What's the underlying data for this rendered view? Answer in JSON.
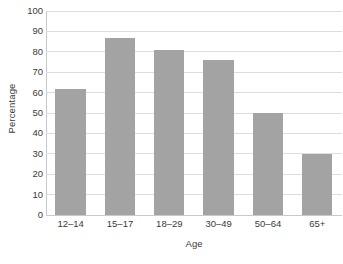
{
  "chart_data": {
    "type": "bar",
    "title": "",
    "subtitle": "",
    "categories": [
      "12–14",
      "15–17",
      "18–29",
      "30–49",
      "50–64",
      "65+"
    ],
    "values": [
      62,
      87,
      81,
      76,
      50,
      30
    ],
    "series": [
      {
        "name": "Percentage",
        "values": [
          62,
          87,
          81,
          76,
          50,
          30
        ]
      }
    ],
    "xlabel": "Age",
    "ylabel": "Percentage",
    "ylim": [
      0,
      100
    ],
    "ytick_interval": 10,
    "yticks": [
      0,
      10,
      20,
      30,
      40,
      50,
      60,
      70,
      80,
      90,
      100
    ],
    "ytick_labels": [
      "0",
      "10",
      "20",
      "30",
      "40",
      "50",
      "60",
      "70",
      "80",
      "90",
      "100"
    ],
    "grid": true,
    "grid_axis": "y",
    "legend": false,
    "legend_position": "none",
    "annotations": [],
    "colors": {
      "bar_fill": "#a3a3a3",
      "gridline": "#dddddd",
      "axis_line": "#c9c9c9",
      "text": "#3a3a3a",
      "background": "#ffffff"
    }
  }
}
